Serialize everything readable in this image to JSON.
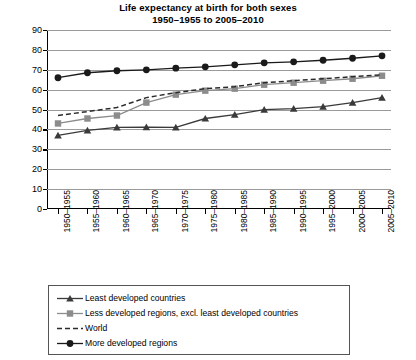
{
  "chart_data": {
    "type": "line",
    "title": "Life expectancy at birth for both sexes",
    "subtitle": "1950–1955 to 2005–2010",
    "xlabel": "",
    "ylabel": "",
    "ylim": [
      0,
      90
    ],
    "ytick_step": 10,
    "grid": true,
    "legend_position": "bottom",
    "categories": [
      "1950–1955",
      "1955–1960",
      "1960–1965",
      "1965–1970",
      "1970–1975",
      "1975–1980",
      "1980–1985",
      "1985–1990",
      "1990–1995",
      "1995–2000",
      "2000–2005",
      "2005–2010"
    ],
    "yticks": [
      "0",
      "10",
      "20",
      "30",
      "40",
      "50",
      "60",
      "70",
      "80",
      "90"
    ],
    "series": [
      {
        "name": "Least developed countries",
        "marker": "triangle",
        "style": "solid",
        "color": "#3a3a3a",
        "values": [
          37,
          39.5,
          41,
          41.2,
          41,
          45.5,
          47.5,
          50,
          50.5,
          51.5,
          53.5,
          56
        ]
      },
      {
        "name": "Less developed regions, excl. least developed countries",
        "marker": "square",
        "style": "solid",
        "color": "#8c8c8c",
        "values": [
          43,
          45.5,
          47,
          53.5,
          57.5,
          59.5,
          60.5,
          62.5,
          63.5,
          64.5,
          65.5,
          67
        ]
      },
      {
        "name": "World",
        "marker": "none",
        "style": "dashed",
        "color": "#2b2b2b",
        "values": [
          47,
          49,
          51,
          56,
          58.5,
          60.5,
          61.5,
          63.5,
          64.5,
          65.5,
          66.5,
          67.5
        ]
      },
      {
        "name": "More developed regions",
        "marker": "circle",
        "style": "solid",
        "color": "#1a1a1a",
        "values": [
          66,
          68.5,
          69.5,
          70,
          70.8,
          71.5,
          72.5,
          73.5,
          74,
          74.8,
          75.8,
          77
        ]
      }
    ]
  }
}
